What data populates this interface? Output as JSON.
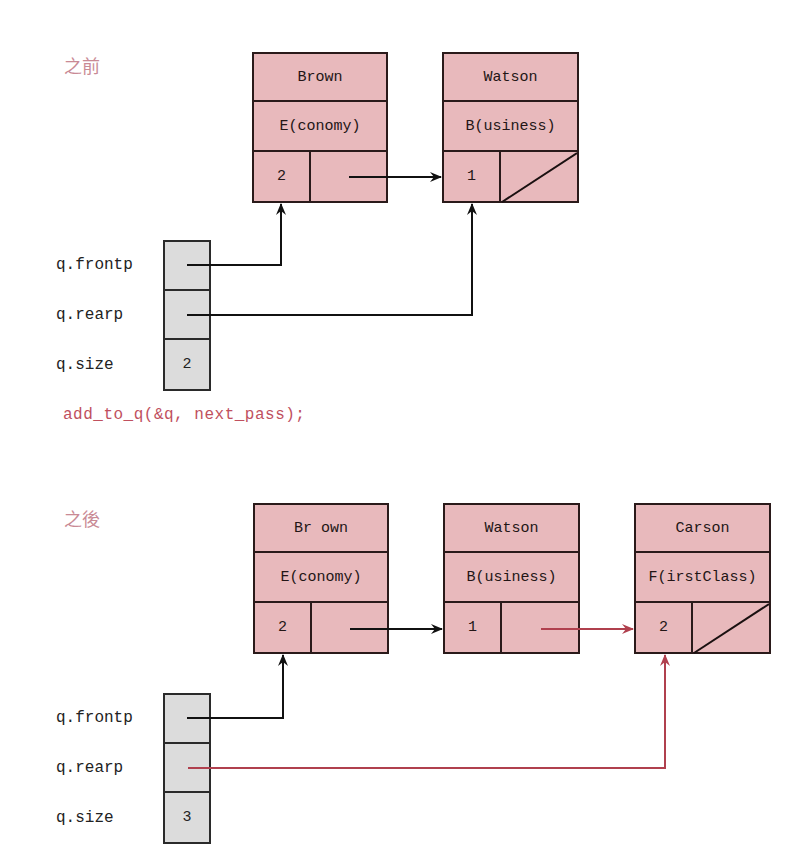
{
  "colors": {
    "node_fill": "#e8b9bc",
    "queue_fill": "#dcdcdc",
    "border": "#2a1a1a",
    "new_link": "#b0404e",
    "label_pink": "#c98a95",
    "code_red": "#c0505e"
  },
  "before": {
    "label": "之前",
    "nodes": [
      {
        "name": "Brown",
        "class": "E(conomy)",
        "num": "2",
        "next": "pointer"
      },
      {
        "name": "Watson",
        "class": "B(usiness)",
        "num": "1",
        "next": "null"
      }
    ],
    "queue": {
      "frontp_label": "q.frontp",
      "rearp_label": "q.rearp",
      "size_label": "q.size",
      "size_value": "2"
    }
  },
  "call": "add_to_q(&q, next_pass);",
  "after": {
    "label": "之後",
    "nodes": [
      {
        "name": "Br own",
        "class": "E(conomy)",
        "num": "2",
        "next": "pointer"
      },
      {
        "name": "Watson",
        "class": "B(usiness)",
        "num": "1",
        "next": "pointer"
      },
      {
        "name": "Carson",
        "class": "F(irstClass)",
        "num": "2",
        "next": "null"
      }
    ],
    "queue": {
      "frontp_label": "q.frontp",
      "rearp_label": "q.rearp",
      "size_label": "q.size",
      "size_value": "3"
    }
  }
}
